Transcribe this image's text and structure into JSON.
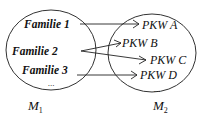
{
  "diagram": {
    "type": "set-mapping",
    "set_left": {
      "name": "M",
      "subscript": "1",
      "elements": [
        "Familie 1",
        "Familie 2",
        "Familie 3"
      ],
      "ellipsis": "..."
    },
    "set_right": {
      "name": "M",
      "subscript": "2",
      "elements": [
        "PKW A",
        "PKW B",
        "PKW C",
        "PKW D"
      ],
      "ellipsis": "..."
    },
    "mappings": [
      {
        "from": "Familie 1",
        "to": "PKW A"
      },
      {
        "from": "Familie 2",
        "to": "PKW B"
      },
      {
        "from": "Familie 2",
        "to": "PKW C"
      },
      {
        "from": "Familie 3",
        "to": "PKW D"
      }
    ]
  }
}
